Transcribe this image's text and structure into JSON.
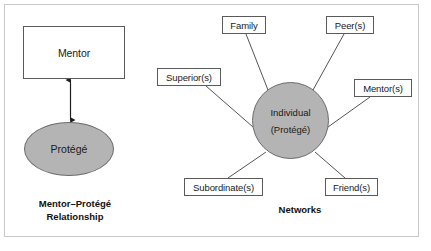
{
  "figure": {
    "left_panel": {
      "mentor_label": "Mentor",
      "protege_label": "Protégé",
      "caption_line1": "Mentor–Protégé",
      "caption_line2": "Relationship"
    },
    "right_panel": {
      "hub_line1": "Individual",
      "hub_line2": "(Protégé)",
      "caption": "Networks",
      "nodes": [
        {
          "id": "family",
          "label": "Family"
        },
        {
          "id": "peers",
          "label": "Peer(s)"
        },
        {
          "id": "superiors",
          "label": "Superior(s)"
        },
        {
          "id": "mentors",
          "label": "Mentor(s)"
        },
        {
          "id": "subordinates",
          "label": "Subordinate(s)"
        },
        {
          "id": "friends",
          "label": "Friend(s)"
        }
      ]
    },
    "colors": {
      "shape_fill": "#b4b4b4",
      "shape_stroke": "#6b6b6b",
      "box_stroke": "#5a5a5a",
      "frame_stroke": "#c9c9c9",
      "connector": "#555555",
      "text": "#1a1a1a"
    }
  }
}
